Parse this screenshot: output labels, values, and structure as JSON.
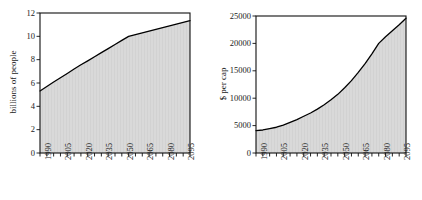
{
  "figure": {
    "background": "#ffffff",
    "fill_color": "#d9d9d9",
    "line_color": "#000000",
    "axis_color": "#101010"
  },
  "chart_data": [
    {
      "id": "population",
      "type": "area",
      "title": "",
      "subtitle": "",
      "xlabel": "",
      "ylabel": "billions of people",
      "xlim": [
        1990,
        2100
      ],
      "ylim": [
        0,
        12
      ],
      "grid": false,
      "legend": "none",
      "y_ticks": [
        0,
        2,
        4,
        6,
        8,
        10,
        12
      ],
      "y_tick_labels": [
        "0",
        "2",
        "4",
        "6",
        "8",
        "10",
        "12"
      ],
      "x_tick_labels": [
        "1990",
        "2005",
        "2020",
        "2035",
        "2050",
        "2065",
        "2080",
        "2095"
      ],
      "x_tick_values": [
        1990,
        2005,
        2020,
        2035,
        2050,
        2065,
        2080,
        2095
      ],
      "x_minor_tick_step": 5,
      "x": [
        1990,
        1995,
        2000,
        2005,
        2010,
        2015,
        2020,
        2025,
        2030,
        2035,
        2040,
        2045,
        2050,
        2055,
        2060,
        2065,
        2070,
        2075,
        2080,
        2085,
        2090,
        2095,
        2100
      ],
      "values": [
        5.32,
        5.7,
        6.08,
        6.45,
        6.82,
        7.2,
        7.56,
        7.9,
        8.25,
        8.6,
        8.95,
        9.3,
        9.65,
        10.0,
        10.15,
        10.3,
        10.45,
        10.6,
        10.75,
        10.9,
        11.05,
        11.2,
        11.35
      ]
    },
    {
      "id": "gdp-per-capita",
      "type": "area",
      "title": "",
      "subtitle": "",
      "xlabel": "",
      "ylabel": "$ per cap",
      "xlim": [
        1990,
        2100
      ],
      "ylim": [
        0,
        25000
      ],
      "grid": false,
      "legend": "none",
      "y_ticks": [
        0,
        5000,
        10000,
        15000,
        20000,
        25000
      ],
      "y_tick_labels": [
        "0",
        "5000",
        "10000",
        "15000",
        "20000",
        "25000"
      ],
      "x_tick_labels": [
        "1990",
        "2005",
        "2020",
        "2035",
        "2050",
        "2065",
        "2080",
        "2095"
      ],
      "x_tick_values": [
        1990,
        2005,
        2020,
        2035,
        2050,
        2065,
        2080,
        2095
      ],
      "x_minor_tick_step": 5,
      "x": [
        1990,
        1995,
        2000,
        2005,
        2010,
        2015,
        2020,
        2025,
        2030,
        2035,
        2040,
        2045,
        2050,
        2055,
        2060,
        2065,
        2070,
        2075,
        2080,
        2085,
        2090,
        2095,
        2100
      ],
      "values": [
        4100,
        4200,
        4450,
        4700,
        5100,
        5600,
        6100,
        6700,
        7300,
        8000,
        8800,
        9700,
        10700,
        11900,
        13200,
        14700,
        16300,
        18100,
        20000,
        21200,
        22300,
        23400,
        24600
      ]
    }
  ]
}
